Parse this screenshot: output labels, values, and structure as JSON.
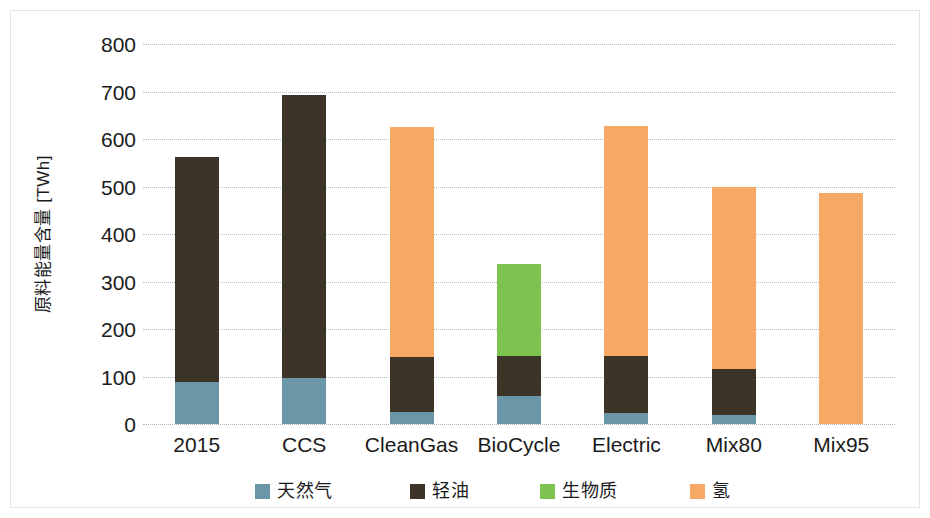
{
  "chart_data": {
    "type": "bar",
    "stacked": true,
    "title": "",
    "xlabel": "",
    "ylabel": "原料能量含量 [TWh]",
    "ylim": [
      0,
      800
    ],
    "ytick_step": 100,
    "ytick_labels": [
      "800",
      "700",
      "600",
      "500",
      "400",
      "300",
      "200",
      "100",
      "0"
    ],
    "grid": true,
    "legend_position": "bottom",
    "categories": [
      "2015",
      "CCS",
      "CleanGas",
      "BioCycle",
      "Electric",
      "Mix80",
      "Mix95"
    ],
    "series": [
      {
        "name": "天然气",
        "color": "#6a96a8",
        "values": [
          88,
          97,
          25,
          58,
          24,
          18,
          0
        ]
      },
      {
        "name": "轻油",
        "color": "#3b3427",
        "values": [
          475,
          596,
          117,
          86,
          119,
          97,
          0
        ]
      },
      {
        "name": "生物质",
        "color": "#7dc24f",
        "values": [
          0,
          0,
          0,
          193,
          0,
          0,
          0
        ]
      },
      {
        "name": "氢",
        "color": "#f5a964",
        "values": [
          0,
          0,
          484,
          0,
          485,
          384,
          486
        ]
      }
    ],
    "totals": [
      563,
      693,
      626,
      337,
      628,
      499,
      486
    ]
  },
  "axis": {
    "y_title": "原料能量含量 [TWh]"
  },
  "legend": {
    "items": [
      {
        "label": "天然气",
        "color": "#6a96a8"
      },
      {
        "label": "轻油",
        "color": "#3b3427"
      },
      {
        "label": "生物质",
        "color": "#7dc24f"
      },
      {
        "label": "氢",
        "color": "#f5a964"
      }
    ]
  }
}
